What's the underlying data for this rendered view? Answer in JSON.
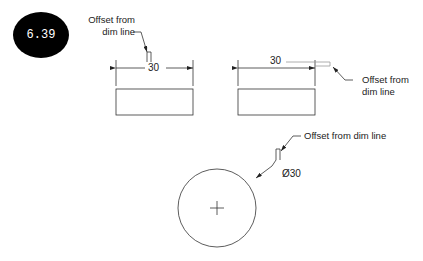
{
  "figure": {
    "number": "6.39",
    "badge_color": "#000000",
    "line_color": "#333333"
  },
  "drawings": [
    {
      "id": "rect-left",
      "dimension_value": "30",
      "annotation_line1": "Offset from",
      "annotation_line2": "dim line"
    },
    {
      "id": "rect-right",
      "dimension_value": "30",
      "annotation_line1": "Offset from",
      "annotation_line2": "dim line"
    },
    {
      "id": "circle",
      "dimension_value": "Ø30",
      "annotation": "Offset from dim line"
    }
  ]
}
